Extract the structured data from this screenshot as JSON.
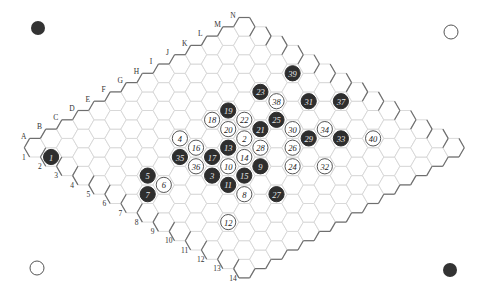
{
  "board": {
    "size": 14,
    "column_labels": [
      "A",
      "B",
      "C",
      "D",
      "E",
      "F",
      "G",
      "H",
      "I",
      "J",
      "K",
      "L",
      "M",
      "N"
    ],
    "row_labels": [
      "1",
      "2",
      "3",
      "4",
      "5",
      "6",
      "7",
      "8",
      "9",
      "10",
      "11",
      "12",
      "13",
      "14"
    ],
    "colors": {
      "black": "#2e2e2e",
      "white": "#ffffff",
      "grid": "#d6d6d6",
      "border": "#6e6e6e"
    }
  },
  "corner_markers": [
    {
      "position": "top-left",
      "color": "black"
    },
    {
      "position": "top-right",
      "color": "white"
    },
    {
      "position": "bottom-left",
      "color": "white"
    },
    {
      "position": "bottom-right",
      "color": "black"
    }
  ],
  "moves": [
    {
      "n": 1,
      "cell": "A2",
      "color": "black"
    },
    {
      "n": 2,
      "cell": "H7",
      "color": "white"
    },
    {
      "n": 3,
      "cell": "E8",
      "color": "black"
    },
    {
      "n": 4,
      "cell": "F5",
      "color": "white"
    },
    {
      "n": 5,
      "cell": "C6",
      "color": "black"
    },
    {
      "n": 6,
      "cell": "C7",
      "color": "white"
    },
    {
      "n": 7,
      "cell": "B7",
      "color": "black"
    },
    {
      "n": 8,
      "cell": "E10",
      "color": "white"
    },
    {
      "n": 9,
      "cell": "G9",
      "color": "black"
    },
    {
      "n": 10,
      "cell": "F8",
      "color": "white"
    },
    {
      "n": 11,
      "cell": "E9",
      "color": "black"
    },
    {
      "n": 12,
      "cell": "C11",
      "color": "white"
    },
    {
      "n": 13,
      "cell": "G7",
      "color": "black"
    },
    {
      "n": 14,
      "cell": "G8",
      "color": "white"
    },
    {
      "n": 15,
      "cell": "F9",
      "color": "black"
    },
    {
      "n": 16,
      "cell": "F6",
      "color": "white"
    },
    {
      "n": 17,
      "cell": "F7",
      "color": "black"
    },
    {
      "n": 18,
      "cell": "H5",
      "color": "white"
    },
    {
      "n": 19,
      "cell": "I5",
      "color": "black"
    },
    {
      "n": 20,
      "cell": "H6",
      "color": "white"
    },
    {
      "n": 21,
      "cell": "I7",
      "color": "black"
    },
    {
      "n": 22,
      "cell": "I6",
      "color": "white"
    },
    {
      "n": 23,
      "cell": "K5",
      "color": "black"
    },
    {
      "n": 24,
      "cell": "H10",
      "color": "white"
    },
    {
      "n": 25,
      "cell": "J7",
      "color": "black"
    },
    {
      "n": 26,
      "cell": "I9",
      "color": "white"
    },
    {
      "n": 27,
      "cell": "F11",
      "color": "black"
    },
    {
      "n": 28,
      "cell": "H8",
      "color": "white"
    },
    {
      "n": 29,
      "cell": "J9",
      "color": "black"
    },
    {
      "n": 30,
      "cell": "J8",
      "color": "white"
    },
    {
      "n": 31,
      "cell": "L7",
      "color": "black"
    },
    {
      "n": 32,
      "cell": "I11",
      "color": "white"
    },
    {
      "n": 33,
      "cell": "K10",
      "color": "black"
    },
    {
      "n": 34,
      "cell": "K9",
      "color": "white"
    },
    {
      "n": 35,
      "cell": "E6",
      "color": "black"
    },
    {
      "n": 36,
      "cell": "E7",
      "color": "white"
    },
    {
      "n": 37,
      "cell": "M8",
      "color": "black"
    },
    {
      "n": 38,
      "cell": "K6",
      "color": "white"
    },
    {
      "n": 39,
      "cell": "M5",
      "color": "black"
    },
    {
      "n": 40,
      "cell": "L11",
      "color": "white"
    }
  ]
}
